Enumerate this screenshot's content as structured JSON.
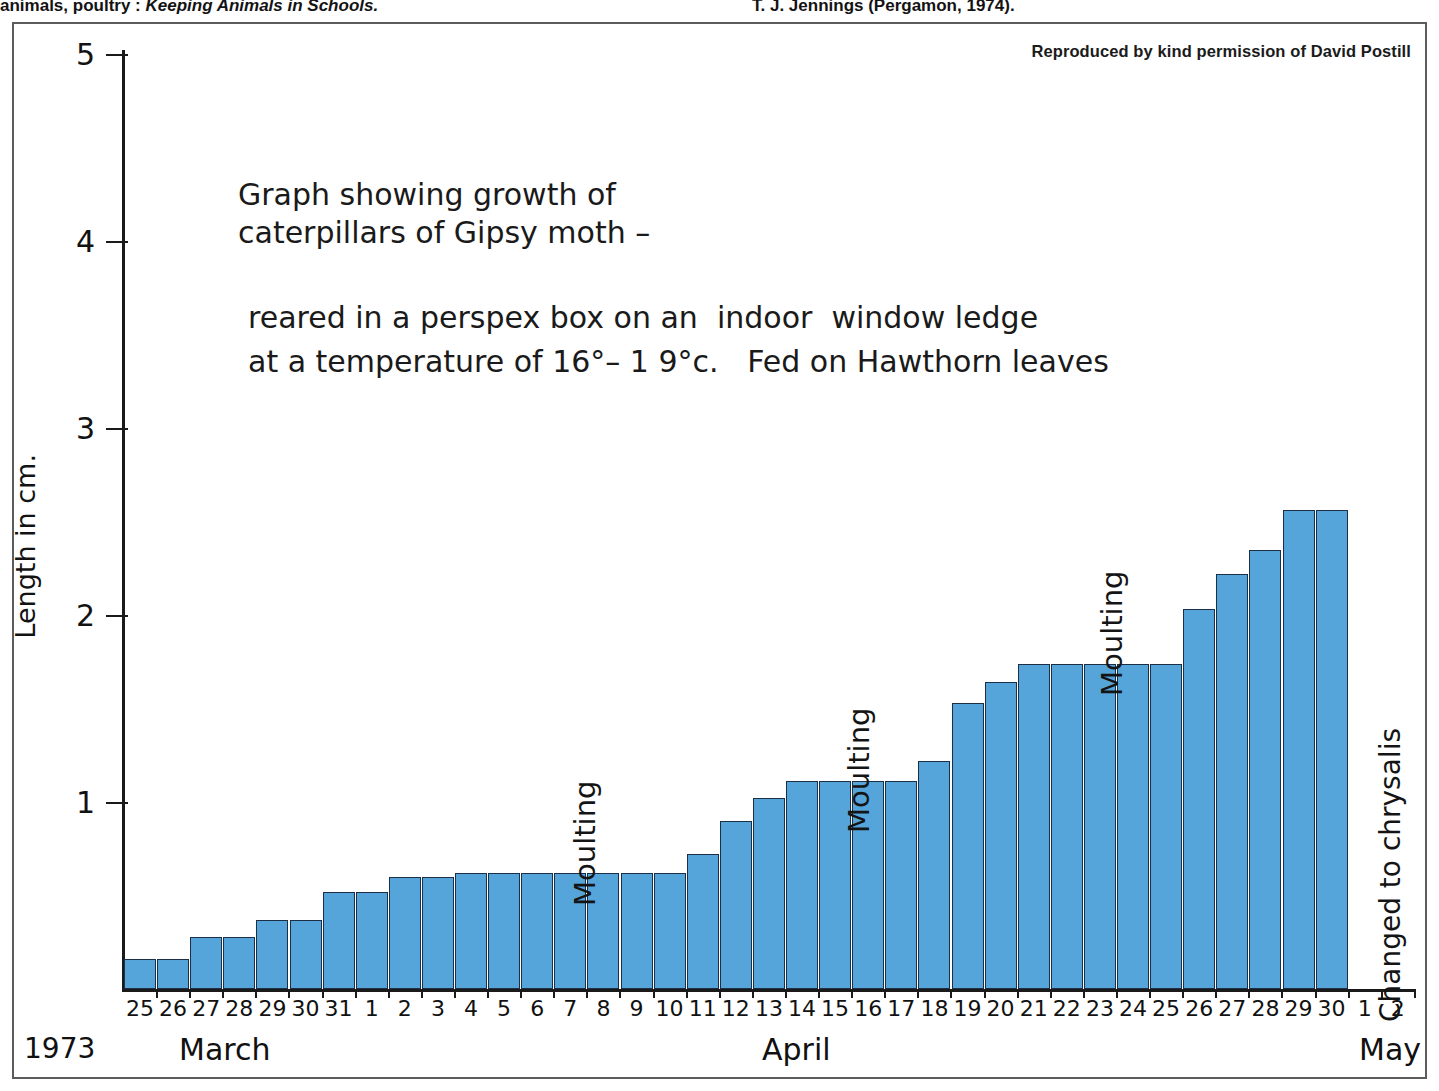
{
  "source_line": {
    "left_pre": "animals, poultry : ",
    "left_italic": "Keeping Animals in Schools.",
    "right": "T. J. Jennings (Pergamon, 1974)."
  },
  "credit": "Reproduced by kind permission of David Postill",
  "annotation": {
    "line1": "Graph showing growth of\ncaterpillars of Gipsy moth –",
    "line2": "reared in a perspex box on an  indoor  window ledge\nat a temperature of 16°– 1 9°c.   Fed on Hawthorn leaves"
  },
  "axis": {
    "y_title": "Length in cm.",
    "year": "1973",
    "month_march": "March",
    "month_april": "April",
    "month_may": "May"
  },
  "callouts": {
    "moulting_1": "Moulting",
    "moulting_2": "Moulting",
    "moulting_3": "Moulting",
    "chrysalis": "Changed to chrysalis"
  },
  "colors": {
    "bar_fill": "#55a5db",
    "bar_stroke": "#1c2f46",
    "axis": "#1a1a1a",
    "frame": "#5c5c5c"
  },
  "chart_data": {
    "type": "bar",
    "title": "Graph showing growth of caterpillars of Gipsy moth",
    "subtitle": "reared in a perspex box on an indoor window ledge at a temperature of 16°-19°c. Fed on Hawthorn leaves",
    "xlabel": "1973",
    "ylabel": "Length in cm.",
    "ylim": [
      0,
      5
    ],
    "yticks": [
      1,
      2,
      3,
      4,
      5
    ],
    "ytick_labels": [
      "1",
      "2",
      "3",
      "4",
      "5"
    ],
    "grid": false,
    "legend": null,
    "categories": [
      "25",
      "26",
      "27",
      "28",
      "29",
      "30",
      "31",
      "1",
      "2",
      "3",
      "4",
      "5",
      "6",
      "7",
      "8",
      "9",
      "10",
      "11",
      "12",
      "13",
      "14",
      "15",
      "16",
      "17",
      "18",
      "19",
      "20",
      "21",
      "22",
      "23",
      "24",
      "25",
      "26",
      "27",
      "28",
      "29",
      "30",
      "1",
      "2"
    ],
    "category_months": [
      "March",
      "March",
      "March",
      "March",
      "March",
      "March",
      "March",
      "April",
      "April",
      "April",
      "April",
      "April",
      "April",
      "April",
      "April",
      "April",
      "April",
      "April",
      "April",
      "April",
      "April",
      "April",
      "April",
      "April",
      "April",
      "April",
      "April",
      "April",
      "April",
      "April",
      "April",
      "April",
      "April",
      "April",
      "April",
      "April",
      "April",
      "May",
      "May"
    ],
    "values": [
      0.16,
      0.16,
      0.28,
      0.28,
      0.37,
      0.37,
      0.52,
      0.52,
      0.6,
      0.6,
      0.62,
      0.62,
      0.62,
      0.62,
      0.62,
      0.62,
      0.62,
      0.72,
      0.9,
      1.02,
      1.11,
      1.11,
      1.11,
      1.11,
      1.22,
      1.53,
      1.64,
      1.74,
      1.74,
      1.74,
      1.74,
      1.74,
      2.03,
      2.22,
      2.35,
      2.56,
      2.56,
      0,
      0
    ],
    "annotations": [
      {
        "text": "Moulting",
        "category": "7",
        "month": "April"
      },
      {
        "text": "Moulting",
        "category": "14",
        "month": "April"
      },
      {
        "text": "Moulting",
        "category": "22",
        "month": "April"
      },
      {
        "text": "Changed to chrysalis",
        "category": "1",
        "month": "May"
      }
    ]
  }
}
